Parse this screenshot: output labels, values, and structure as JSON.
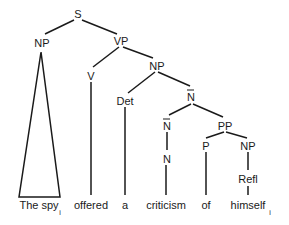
{
  "diagram": {
    "type": "syntax-tree",
    "nodes": {
      "s": "S",
      "np_subj": "NP",
      "vp": "VP",
      "v": "V",
      "np_obj": "NP",
      "det": "Det",
      "nbar_top": "N",
      "nbar_low": "N",
      "n": "N",
      "pp": "PP",
      "p": "P",
      "np_refl": "NP",
      "refl": "Refl"
    },
    "words": {
      "the_spy": "The spy",
      "offered": "offered",
      "a": "a",
      "criticism": "criticism",
      "of": "of",
      "himself": "himself"
    },
    "indices": {
      "subj": "i",
      "refl": "i"
    }
  }
}
